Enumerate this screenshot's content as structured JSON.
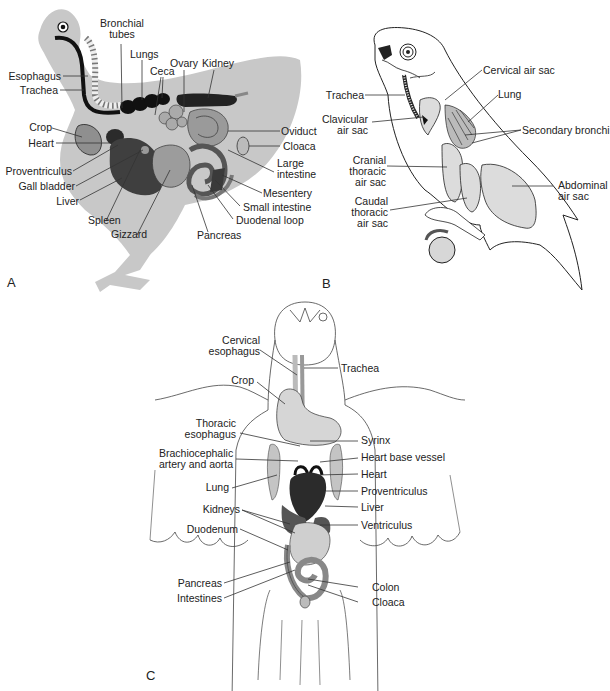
{
  "figure": {
    "panels": [
      {
        "id": "A",
        "letter": "A",
        "subject": "Chicken lateral view - digestive and reproductive organs",
        "labels": {
          "bronchial_tubes_1": "Bronchial",
          "bronchial_tubes_2": "tubes",
          "lungs": "Lungs",
          "ovary": "Ovary",
          "kidney": "Kidney",
          "ceca": "Ceca",
          "esophagus": "Esophagus",
          "trachea": "Trachea",
          "crop": "Crop",
          "heart": "Heart",
          "proventriculus": "Proventriculus",
          "gall_bladder": "Gall bladder",
          "liver": "Liver",
          "spleen": "Spleen",
          "gizzard": "Gizzard",
          "oviduct": "Oviduct",
          "cloaca": "Cloaca",
          "large_intestine_1": "Large",
          "large_intestine_2": "intestine",
          "mesentery": "Mesentery",
          "small_intestine": "Small intestine",
          "duodenal_loop": "Duodenal loop",
          "pancreas": "Pancreas"
        }
      },
      {
        "id": "B",
        "letter": "B",
        "subject": "Bird lateral view - respiratory system and air sacs",
        "labels": {
          "cervical_air_sac": "Cervical air sac",
          "trachea": "Trachea",
          "lung": "Lung",
          "clavicular_air_sac_1": "Clavicular",
          "clavicular_air_sac_2": "air sac",
          "secondary_bronchi": "Secondary bronchi",
          "cranial_thoracic_1": "Cranial",
          "cranial_thoracic_2": "thoracic",
          "cranial_thoracic_3": "air sac",
          "abdominal_1": "Abdominal",
          "abdominal_2": "air sac",
          "caudal_thoracic_1": "Caudal",
          "caudal_thoracic_2": "thoracic",
          "caudal_thoracic_3": "air sac"
        }
      },
      {
        "id": "C",
        "letter": "C",
        "subject": "Bird ventral view - coelomic organs",
        "labels": {
          "cervical_esophagus_1": "Cervical",
          "cervical_esophagus_2": "esophagus",
          "trachea": "Trachea",
          "crop": "Crop",
          "thoracic_esophagus_1": "Thoracic",
          "thoracic_esophagus_2": "esophagus",
          "syrinx": "Syrinx",
          "brachiocephalic_1": "Brachiocephalic",
          "brachiocephalic_2": "artery and aorta",
          "heart_base_vessel": "Heart base vessel",
          "heart": "Heart",
          "lung": "Lung",
          "proventriculus": "Proventriculus",
          "liver": "Liver",
          "kidneys": "Kidneys",
          "ventriculus": "Ventriculus",
          "duodenum": "Duodenum",
          "pancreas": "Pancreas",
          "colon": "Colon",
          "intestines": "Intestines",
          "cloaca": "Cloaca"
        }
      }
    ],
    "colors": {
      "silhouette": "#c8c8c8",
      "organ_mid": "#9a9a9a",
      "organ_dark": "#3c3c3c",
      "organ_black": "#111111",
      "air_sac": "#dcdcdc",
      "line": "#333333"
    }
  }
}
